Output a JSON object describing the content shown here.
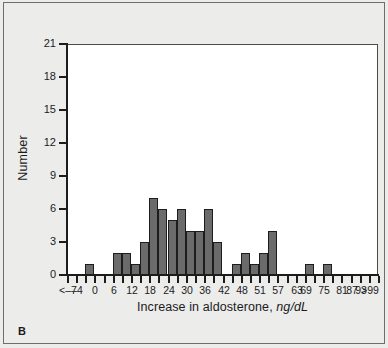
{
  "panel": {
    "letter": "B"
  },
  "chart_data": {
    "type": "bar",
    "title": "",
    "subtitle": "",
    "xlabel": "Increase in aldosterone,",
    "xlabel_units": "ng/dL",
    "ylabel": "Number",
    "ylim": [
      0,
      21
    ],
    "ytick_values": [
      0,
      3,
      6,
      9,
      12,
      15,
      18,
      21
    ],
    "ytick_labels": [
      "0",
      "3",
      "6",
      "9",
      "12",
      "15",
      "18",
      "21"
    ],
    "grid": false,
    "legend": "none",
    "xtick_labels": [
      "<–7",
      "–4",
      "0",
      "6",
      "12",
      "18",
      "24",
      "30",
      "36",
      "42",
      "48",
      "51",
      "57",
      "63",
      "69",
      "75",
      "81",
      "87",
      "93",
      ">99"
    ],
    "bar_color": "#6b6b6b",
    "bar_edge_color": "#1d1d1d",
    "bins": [
      {
        "index": 0,
        "label": "<–7",
        "value": 0
      },
      {
        "index": 1,
        "label": "–4",
        "value": 0
      },
      {
        "index": 2,
        "label": "",
        "value": 1
      },
      {
        "index": 3,
        "label": "0",
        "value": 0
      },
      {
        "index": 4,
        "label": "",
        "value": 0
      },
      {
        "index": 5,
        "label": "6",
        "value": 2
      },
      {
        "index": 6,
        "label": "",
        "value": 2
      },
      {
        "index": 7,
        "label": "12",
        "value": 1
      },
      {
        "index": 8,
        "label": "",
        "value": 3
      },
      {
        "index": 9,
        "label": "18",
        "value": 7
      },
      {
        "index": 10,
        "label": "",
        "value": 6
      },
      {
        "index": 11,
        "label": "24",
        "value": 5
      },
      {
        "index": 12,
        "label": "",
        "value": 6
      },
      {
        "index": 13,
        "label": "30",
        "value": 4
      },
      {
        "index": 14,
        "label": "",
        "value": 4
      },
      {
        "index": 15,
        "label": "36",
        "value": 6
      },
      {
        "index": 16,
        "label": "",
        "value": 3
      },
      {
        "index": 17,
        "label": "42",
        "value": 0
      },
      {
        "index": 18,
        "label": "",
        "value": 1
      },
      {
        "index": 19,
        "label": "48",
        "value": 2
      },
      {
        "index": 20,
        "label": "",
        "value": 1
      },
      {
        "index": 21,
        "label": "51",
        "value": 2
      },
      {
        "index": 22,
        "label": "",
        "value": 4
      },
      {
        "index": 23,
        "label": "57",
        "value": 0
      },
      {
        "index": 24,
        "label": "",
        "value": 0
      },
      {
        "index": 25,
        "label": "63",
        "value": 0
      },
      {
        "index": 26,
        "label": "69",
        "value": 1
      },
      {
        "index": 27,
        "label": "",
        "value": 0
      },
      {
        "index": 28,
        "label": "75",
        "value": 1
      },
      {
        "index": 29,
        "label": "",
        "value": 0
      },
      {
        "index": 30,
        "label": "81",
        "value": 0
      },
      {
        "index": 31,
        "label": "87",
        "value": 0
      },
      {
        "index": 32,
        "label": "93",
        "value": 0
      },
      {
        "index": 33,
        "label": ">99",
        "value": 0
      }
    ]
  }
}
